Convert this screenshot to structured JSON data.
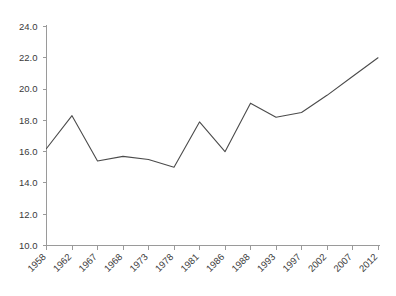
{
  "chart_data": {
    "type": "line",
    "title": "",
    "subtitle": "",
    "xlabel": "",
    "ylabel": "",
    "categories": [
      "1958",
      "1962",
      "1967",
      "1968",
      "1973",
      "1978",
      "1981",
      "1986",
      "1988",
      "1993",
      "1997",
      "2002",
      "2007",
      "2012"
    ],
    "values": [
      16.2,
      18.3,
      15.4,
      15.7,
      15.5,
      15.0,
      17.9,
      16.0,
      19.1,
      18.2,
      18.5,
      19.6,
      20.8,
      22.0
    ],
    "series": [
      {
        "name": "series-1",
        "values": [
          16.2,
          18.3,
          15.4,
          15.7,
          15.5,
          15.0,
          17.9,
          16.0,
          19.1,
          18.2,
          18.5,
          19.6,
          20.8,
          22.0
        ],
        "color": "#4b4b4b"
      }
    ],
    "ylim": [
      10.0,
      24.0
    ],
    "ytick_labels": [
      "24.0",
      "22.0",
      "20.0",
      "18.0",
      "16.0",
      "14.0",
      "12.0",
      "10.0"
    ],
    "ytick_values": [
      24.0,
      22.0,
      20.0,
      18.0,
      16.0,
      14.0,
      12.0,
      10.0
    ],
    "xtick_labels": [
      "1958",
      "1962",
      "1967",
      "1968",
      "1973",
      "1978",
      "1981",
      "1986",
      "1988",
      "1993",
      "1997",
      "2002",
      "2007",
      "2012"
    ],
    "grid": false,
    "legend": "none",
    "xtick_rotation": -45,
    "line_color": "#4b4b4b",
    "axis_color": "#9a9a9a",
    "background_color": "#ffffff"
  },
  "watermark": {
    "text": ""
  }
}
